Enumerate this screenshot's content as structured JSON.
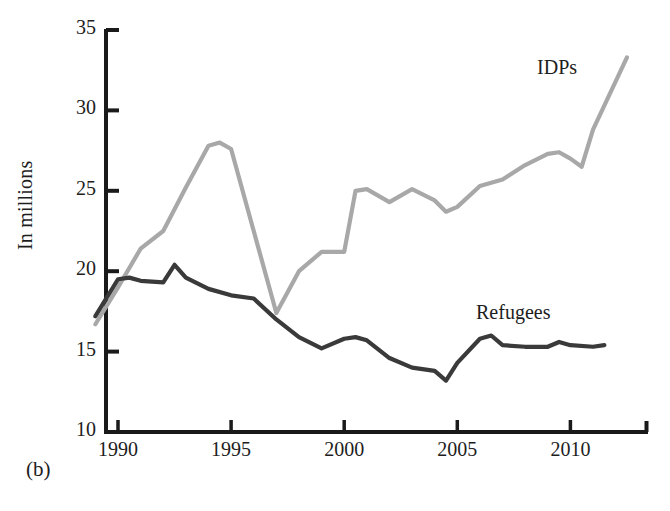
{
  "figure": {
    "panel_label": "(b)",
    "ylabel": "In millions"
  },
  "axis": {
    "y_ticks": [
      "10",
      "15",
      "20",
      "25",
      "30",
      "35"
    ],
    "x_ticks": [
      "1990",
      "1995",
      "2000",
      "2005",
      "2010"
    ]
  },
  "series_labels": {
    "idps": "IDPs",
    "refugees": "Refugees"
  },
  "colors": {
    "idps_line": "#a8a8a8",
    "refugees_line": "#3a3a3a",
    "axis": "#1a1a1a",
    "background": "#ffffff"
  },
  "chart_data": {
    "type": "line",
    "title": "",
    "subtitle": "",
    "xlabel": "",
    "ylabel": "In millions",
    "xlim": [
      1989,
      2013
    ],
    "ylim": [
      10,
      35
    ],
    "y_tick_values": [
      10,
      15,
      20,
      25,
      30,
      35
    ],
    "x_tick_values": [
      1990,
      1995,
      2000,
      2005,
      2010
    ],
    "grid": false,
    "legend": "inline-labels",
    "annotations": [
      {
        "text": "IDPs",
        "x": 2009.5,
        "y": 32.5
      },
      {
        "text": "Refugees",
        "x": 2006.8,
        "y": 17.3
      }
    ],
    "series": [
      {
        "name": "IDPs",
        "color": "#a8a8a8",
        "x": [
          1989.0,
          1990.0,
          1991.0,
          1992.0,
          1993.0,
          1994.0,
          1994.5,
          1995.0,
          1996.0,
          1997.0,
          1998.0,
          1999.0,
          2000.0,
          2000.5,
          2001.0,
          2002.0,
          2003.0,
          2004.0,
          2004.5,
          2005.0,
          2006.0,
          2006.5,
          2007.0,
          2008.0,
          2009.0,
          2009.5,
          2010.0,
          2010.5,
          2011.0,
          2012.5
        ],
        "values": [
          16.7,
          19.0,
          21.4,
          22.5,
          25.2,
          27.8,
          28.0,
          27.6,
          22.5,
          17.4,
          20.0,
          21.2,
          21.2,
          25.0,
          25.1,
          24.3,
          25.1,
          24.4,
          23.7,
          24.0,
          25.3,
          25.5,
          25.7,
          26.6,
          27.3,
          27.4,
          27.0,
          26.5,
          28.8,
          33.3
        ]
      },
      {
        "name": "Refugees",
        "color": "#3a3a3a",
        "x": [
          1989.0,
          1990.0,
          1990.5,
          1991.0,
          1992.0,
          1992.5,
          1993.0,
          1994.0,
          1995.0,
          1996.0,
          1997.0,
          1998.0,
          1999.0,
          2000.0,
          2000.5,
          2001.0,
          2002.0,
          2003.0,
          2004.0,
          2004.5,
          2005.0,
          2006.0,
          2006.5,
          2007.0,
          2008.0,
          2009.0,
          2009.5,
          2010.0,
          2011.0,
          2011.5
        ],
        "values": [
          17.2,
          19.5,
          19.6,
          19.4,
          19.3,
          20.4,
          19.6,
          18.9,
          18.5,
          18.3,
          17.0,
          15.9,
          15.2,
          15.8,
          15.9,
          15.7,
          14.6,
          14.0,
          13.8,
          13.2,
          14.3,
          15.8,
          16.0,
          15.4,
          15.3,
          15.3,
          15.6,
          15.4,
          15.3,
          15.4
        ]
      }
    ]
  }
}
